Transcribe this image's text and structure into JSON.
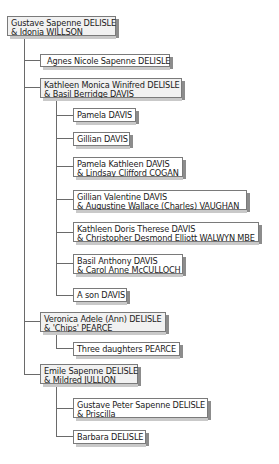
{
  "diagram": {
    "type": "family-tree",
    "colors": {
      "line": "#6a6a6a",
      "border": "#7a7a7a",
      "parent_fill": "#f1f1f1",
      "leaf_fill": "#ffffff",
      "shadow": "#8c8c8c"
    },
    "root": {
      "line1": "Gustave Sapenne DELISLE",
      "line2": "& Idonia WILLSON"
    },
    "children": [
      {
        "line1": "Agnes Nicole Sapenne DELISLE"
      },
      {
        "line1": "Kathleen Monica Winifred DELISLE",
        "line2": "& Basil Berridge DAVIS",
        "children": [
          {
            "line1": "Pamela DAVIS"
          },
          {
            "line1": "Gillian DAVIS"
          },
          {
            "line1": "Pamela Kathleen DAVIS",
            "line2": "& Lindsay Clifford COGAN"
          },
          {
            "line1": "Gillian Valentine DAVIS",
            "line2": "& Augustine Wallace (Charles) VAUGHAN"
          },
          {
            "line1": "Kathleen  Doris Therese DAVIS",
            "line2": "& Christopher Desmond Elliott WALWYN MBE"
          },
          {
            "line1": "Basil Anthony DAVIS",
            "line2": "& Carol Anne McCULLOCH"
          },
          {
            "line1": "A son DAVIS"
          }
        ]
      },
      {
        "line1": "Veronica Adele (Ann) DELISLE",
        "line2": "& 'Chips' PEARCE",
        "children": [
          {
            "line1": "Three daughters PEARCE"
          }
        ]
      },
      {
        "line1": "Emile Sapenne DELISLE",
        "line2": "& Mildred JULLION",
        "children": [
          {
            "line1": "Gustave Peter  Sapenne DELISLE",
            "line2": "& Priscilla"
          },
          {
            "line1": "Barbara DELISLE"
          }
        ]
      }
    ]
  }
}
